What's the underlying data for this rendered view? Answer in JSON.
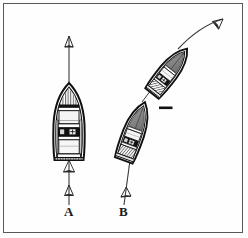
{
  "figure": {
    "background_color": "#fdfdfd",
    "border_color": "#58585a",
    "ink_color": "#1a1a1a"
  },
  "labels": {
    "vessel_a": "A",
    "vessel_b": "B"
  },
  "vessels": [
    {
      "id": "boat-a",
      "label": "A",
      "heading_degrees": 0,
      "description": "Boat A viewed from above, bow pointing up, travelling straight ahead",
      "hull_fill": "#ffffff",
      "seat_fill": "#f2f2f2",
      "dark_band_fill": "#111111"
    },
    {
      "id": "boat-b-start",
      "label": "B",
      "heading_degrees": 20,
      "description": "Boat B initial position, bow pointing up and slightly right",
      "hull_fill": "#ffffff",
      "seat_fill": "#f2f2f2",
      "dark_band_fill": "#111111"
    },
    {
      "id": "boat-b-turned",
      "label": "B",
      "heading_degrees": 38,
      "description": "Boat B after altering course to starboard",
      "hull_fill": "#ffffff",
      "seat_fill": "#f2f2f2",
      "dark_band_fill": "#111111"
    }
  ],
  "tracks": [
    {
      "id": "track-a",
      "vessel": "A",
      "type": "straight",
      "arrowheads": [
        "approach-up",
        "ahead-up"
      ],
      "description": "Straight vertical course line through boat A with upward arrowheads below and above"
    },
    {
      "id": "track-b-approach",
      "vessel": "B",
      "type": "straight",
      "arrowheads": [
        "approach-up"
      ],
      "description": "Straight approach line below boat B with an upward arrowhead"
    },
    {
      "id": "track-b-turn",
      "vessel": "B",
      "type": "curved",
      "arrowheads": [
        "ahead-upper-right"
      ],
      "description": "Curved track sweeping up and to the right, ending in an arrowhead"
    }
  ],
  "annotations": [
    {
      "id": "dash-mark",
      "symbol": "—",
      "description": "Short horizontal dash mark placed between the two positions of boat B"
    }
  ]
}
